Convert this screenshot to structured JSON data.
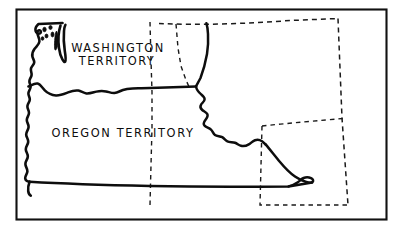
{
  "figure": {
    "kind": "historical-outline-map",
    "background_color": "#ffffff",
    "ink_color": "#0d0d0d",
    "width": 400,
    "height": 235
  },
  "frame": {
    "name": "map-border",
    "stroke_color": "#111111",
    "stroke_width": 2.1
  },
  "labels": {
    "washington": {
      "line1": "WASHINGTON",
      "line2": "TERRITORY",
      "x": 118,
      "y_line1": 52,
      "y_line2": 65
    },
    "oregon": {
      "line1": "OREGON  TERRITORY",
      "x": 123,
      "y_line1": 137
    }
  },
  "features": [
    {
      "name": "pacific-coastline",
      "style": "solid",
      "description": "Pacific Ocean shoreline of Washington and Oregon with wavy detail"
    },
    {
      "name": "olympic-peninsula",
      "style": "solid",
      "description": "Olympic Peninsula and Puget Sound inlet"
    },
    {
      "name": "san-juan-islands",
      "style": "solid-filled",
      "description": "Small filled islands in Puget Sound / Strait of Juan de Fuca"
    },
    {
      "name": "columbia-river-boundary",
      "style": "solid",
      "description": "Boundary between Washington Territory and Oregon Territory following the Columbia River then the 46th parallel"
    },
    {
      "name": "continental-divide-boundary",
      "style": "solid",
      "description": "Jagged eastern territorial limit along the Rocky Mountain continental divide"
    },
    {
      "name": "southern-boundary-42nd-parallel",
      "style": "solid",
      "description": "Southern territorial limit at the 42nd parallel"
    },
    {
      "name": "northern-boundary-49th-parallel",
      "style": "dashed",
      "description": "Northern boundary with British territory at the 49th parallel"
    },
    {
      "name": "modern-state-border-idaho-west",
      "style": "dashed",
      "description": "Vertical dashed present-day Washington / Idaho and Oregon / Idaho border"
    },
    {
      "name": "modern-state-border-montana-west",
      "style": "dashed",
      "description": "Vertical dashed present-day Idaho / Montana border"
    },
    {
      "name": "modern-state-border-montana-wyoming",
      "style": "dashed",
      "description": "Horizontal dashed present-day Montana / Wyoming border"
    },
    {
      "name": "modern-state-border-wyoming-box",
      "style": "dashed",
      "description": "Dashed rectangle outlining present-day Wyoming at the southeast"
    }
  ]
}
